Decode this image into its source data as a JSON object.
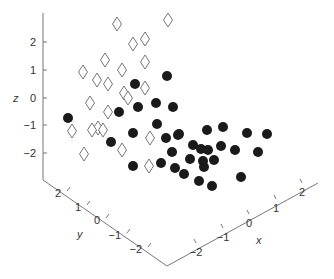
{
  "chart_data": {
    "type": "scatter",
    "dimensions": 3,
    "title": "",
    "xlabel": "x",
    "ylabel": "y",
    "zlabel": "z",
    "xlim": [
      -2.5,
      2.5
    ],
    "ylim": [
      -2.5,
      2.5
    ],
    "zlim": [
      -3,
      3
    ],
    "x_ticks": [
      "-2",
      "-1",
      "0",
      "1",
      "2"
    ],
    "y_ticks": [
      "2",
      "1",
      "0",
      "-1",
      "-2"
    ],
    "z_ticks": [
      "2",
      "1",
      "0",
      "-1",
      "-2"
    ],
    "grid": false,
    "legend": null,
    "series": [
      {
        "name": "class-diamond",
        "marker": "open-diamond",
        "color": "#666666",
        "screen_points": [
          [
            168,
            20
          ],
          [
            117,
            24
          ],
          [
            145,
            39
          ],
          [
            133,
            44
          ],
          [
            105,
            60
          ],
          [
            145,
            62
          ],
          [
            83,
            72
          ],
          [
            122,
            70
          ],
          [
            97,
            80
          ],
          [
            108,
            84
          ],
          [
            145,
            88
          ],
          [
            124,
            93
          ],
          [
            128,
            98
          ],
          [
            90,
            103
          ],
          [
            108,
            112
          ],
          [
            98,
            128
          ],
          [
            72,
            131
          ],
          [
            92,
            130
          ],
          [
            103,
            130
          ],
          [
            150,
            138
          ],
          [
            122,
            150
          ],
          [
            84,
            154
          ],
          [
            149,
            166
          ]
        ]
      },
      {
        "name": "class-dot",
        "marker": "filled-circle",
        "color": "#1a1a1a",
        "screen_points": [
          [
            167,
            76
          ],
          [
            135,
            84
          ],
          [
            68,
            118
          ],
          [
            119,
            112
          ],
          [
            138,
            107
          ],
          [
            156,
            103
          ],
          [
            173,
            107
          ],
          [
            157,
            124
          ],
          [
            133,
            133
          ],
          [
            166,
            138
          ],
          [
            178,
            135
          ],
          [
            111,
            142
          ],
          [
            172,
            152
          ],
          [
            133,
            166
          ],
          [
            161,
            163
          ],
          [
            175,
            168
          ],
          [
            179,
            134
          ],
          [
            207,
            130
          ],
          [
            223,
            127
          ],
          [
            247,
            133
          ],
          [
            267,
            134
          ],
          [
            193,
            145
          ],
          [
            201,
            149
          ],
          [
            208,
            150
          ],
          [
            221,
            146
          ],
          [
            235,
            150
          ],
          [
            258,
            152
          ],
          [
            190,
            159
          ],
          [
            203,
            161
          ],
          [
            214,
            160
          ],
          [
            204,
            167
          ],
          [
            184,
            174
          ],
          [
            199,
            181
          ],
          [
            212,
            186
          ],
          [
            241,
            177
          ]
        ]
      }
    ]
  },
  "axes": {
    "z": {
      "label": "z",
      "ticks": [
        {
          "t": "2",
          "y": 42
        },
        {
          "t": "1",
          "y": 70
        },
        {
          "t": "0",
          "y": 98
        },
        {
          "t": "−1",
          "y": 125
        },
        {
          "t": "−2",
          "y": 153
        }
      ]
    },
    "y": {
      "label": "y",
      "ticks": [
        {
          "t": "2",
          "x": 61,
          "y": 193
        },
        {
          "t": "1",
          "x": 81,
          "y": 207
        },
        {
          "t": "0",
          "x": 100,
          "y": 220
        },
        {
          "t": "−1",
          "x": 121,
          "y": 235
        },
        {
          "t": "−2",
          "x": 142,
          "y": 249
        }
      ]
    },
    "x": {
      "label": "x",
      "ticks": [
        {
          "t": "−2",
          "x": 196,
          "y": 252
        },
        {
          "t": "−1",
          "x": 223,
          "y": 237
        },
        {
          "t": "0",
          "x": 249,
          "y": 223
        },
        {
          "t": "1",
          "x": 276,
          "y": 208
        },
        {
          "t": "2",
          "x": 302,
          "y": 192
        }
      ]
    }
  },
  "colors": {
    "axis": "#777777",
    "text": "#333333",
    "dot": "#1a1a1a",
    "diamond_stroke": "#666666"
  }
}
